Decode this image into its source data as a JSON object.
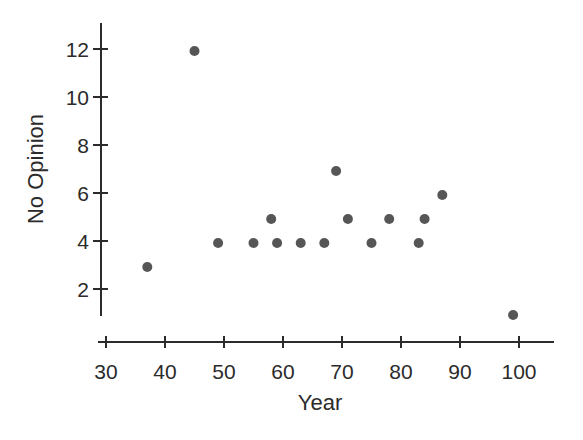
{
  "figure": {
    "background_color": "#ffffff",
    "ink_color": "#2b2b2b"
  },
  "chart_data": {
    "type": "scatter",
    "xlabel": "Year",
    "ylabel": "No Opinion",
    "x_ticks": [
      30,
      40,
      50,
      60,
      70,
      80,
      90,
      100
    ],
    "y_ticks": [
      2,
      4,
      6,
      8,
      10,
      12
    ],
    "xlim": [
      30,
      100
    ],
    "ylim": [
      1,
      13
    ],
    "grid": false,
    "legend": null,
    "point_color": "#4d4d4d",
    "axis_color": "#2b2b2b",
    "points": [
      {
        "x": 37,
        "y": 3
      },
      {
        "x": 45,
        "y": 12
      },
      {
        "x": 49,
        "y": 4
      },
      {
        "x": 55,
        "y": 4
      },
      {
        "x": 58,
        "y": 5
      },
      {
        "x": 59,
        "y": 4
      },
      {
        "x": 63,
        "y": 4
      },
      {
        "x": 67,
        "y": 4
      },
      {
        "x": 69,
        "y": 7
      },
      {
        "x": 71,
        "y": 5
      },
      {
        "x": 75,
        "y": 4
      },
      {
        "x": 78,
        "y": 5
      },
      {
        "x": 83,
        "y": 4
      },
      {
        "x": 84,
        "y": 5
      },
      {
        "x": 87,
        "y": 6
      },
      {
        "x": 99,
        "y": 1
      }
    ]
  }
}
